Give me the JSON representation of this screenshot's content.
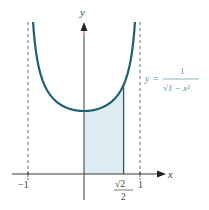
{
  "chart_data": {
    "type": "area",
    "title": "",
    "function_label": {
      "lhs": "y =",
      "numerator": "1",
      "denominator": "√1 − x²"
    },
    "xlabel": "x",
    "ylabel": "y",
    "x_ticks": [
      {
        "value": -1,
        "label": "−1"
      },
      {
        "value": 0.7071,
        "label_num": "√2",
        "label_den": "2"
      },
      {
        "value": 1,
        "label": "1"
      }
    ],
    "asymptotes": [
      -1,
      1
    ],
    "shaded_region": {
      "from": 0,
      "to": 0.7071
    },
    "series": [
      {
        "name": "y = 1/√(1 − x²)",
        "x": [
          -0.95,
          -0.9,
          -0.8,
          -0.6,
          -0.4,
          -0.2,
          0,
          0.2,
          0.4,
          0.6,
          0.7071,
          0.8,
          0.9,
          0.95
        ],
        "values": [
          3.2,
          2.294,
          1.667,
          1.25,
          1.091,
          1.021,
          1.0,
          1.021,
          1.091,
          1.25,
          1.414,
          1.667,
          2.294,
          3.2
        ]
      }
    ],
    "xlim": [
      -1.3,
      1.3
    ],
    "ylim": [
      -0.5,
      2.8
    ],
    "grid": false,
    "colors": {
      "curve": "#1f5f73",
      "fill": "#dcecf2",
      "axis": "#3a3a3a",
      "asymptote": "#555555",
      "y_axis_top": "#c0392b"
    }
  }
}
